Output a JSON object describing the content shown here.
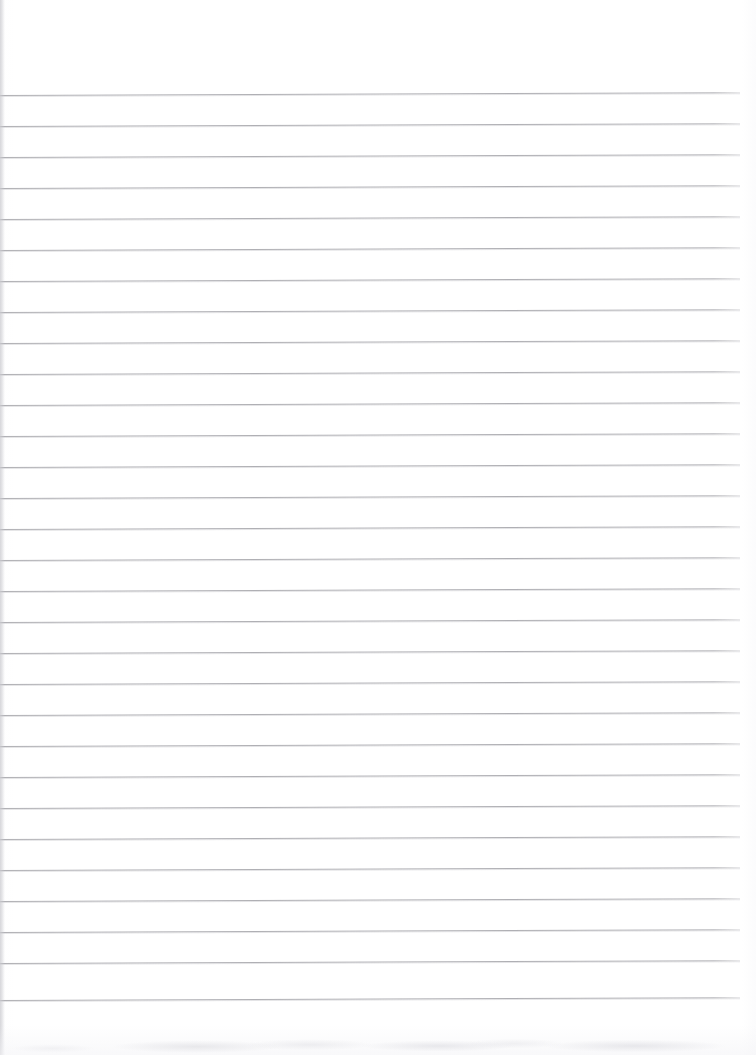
{
  "document": {
    "title": "",
    "type": "scanned-ruled-paper",
    "orientation": "portrait",
    "page_width": 756,
    "page_height": 1055,
    "background_color": "#ffffff",
    "has_text_content": false,
    "notes": ""
  },
  "ruling": {
    "line_color": "#a9a9ae",
    "line_thickness": 1,
    "line_spacing": 31,
    "first_line_y": 95,
    "last_line_y": 1000,
    "line_count": 30,
    "left_x": 0,
    "right_x": 740,
    "skew_degrees": -0.22,
    "lines_y": [
      95,
      126,
      157,
      188,
      219,
      250,
      281,
      312,
      343,
      374,
      405,
      436,
      467,
      498,
      529,
      560,
      591,
      622,
      653,
      684,
      715,
      746,
      777,
      808,
      839,
      870,
      901,
      932,
      963,
      1000
    ]
  },
  "margins": {
    "top_margin_height": 94,
    "bottom_margin_height": 55,
    "right_margin_width": 16,
    "left_margin_width": 0
  },
  "artifacts": {
    "left_edge_shadow_color": "#cdcdd2",
    "bottom_noise_color": "#e4e4e8",
    "paper_tint": "#fcfcfd"
  }
}
